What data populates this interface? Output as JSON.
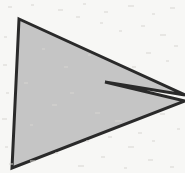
{
  "image": {
    "kind": "scanned-line-drawing",
    "width": 185,
    "height": 173,
    "background_color": "#f7f7f5",
    "description": "Concave arrow-like polygon, gray fill with dark outline, scanned paper texture"
  },
  "shape": {
    "name": "concave-arrow-polygon",
    "fill_color": "#c5c5c5",
    "stroke_color": "#2a2a2a",
    "stroke_width": 3,
    "vertex_count": 5,
    "points": "19,19 185,95 105,82 185,101 12,168",
    "vertices": [
      {
        "label": "top-left-apex",
        "x": 19,
        "y": 19
      },
      {
        "label": "upper-right-tip",
        "x": 185,
        "y": 95
      },
      {
        "label": "concave-notch",
        "x": 105,
        "y": 82
      },
      {
        "label": "lower-right-tip",
        "x": 185,
        "y": 101
      },
      {
        "label": "bottom-left-apex",
        "x": 12,
        "y": 168
      }
    ]
  },
  "texture": {
    "speck_color": "#d8d6d2",
    "speck_count": 46,
    "specks": [
      {
        "x": 8,
        "y": 6,
        "w": 4,
        "h": 2
      },
      {
        "x": 31,
        "y": 4,
        "w": 3,
        "h": 2
      },
      {
        "x": 58,
        "y": 9,
        "w": 5,
        "h": 2
      },
      {
        "x": 83,
        "y": 3,
        "w": 3,
        "h": 2
      },
      {
        "x": 104,
        "y": 11,
        "w": 4,
        "h": 2
      },
      {
        "x": 128,
        "y": 5,
        "w": 6,
        "h": 2
      },
      {
        "x": 152,
        "y": 13,
        "w": 3,
        "h": 2
      },
      {
        "x": 170,
        "y": 7,
        "w": 5,
        "h": 2
      },
      {
        "x": 141,
        "y": 25,
        "w": 4,
        "h": 2
      },
      {
        "x": 160,
        "y": 34,
        "w": 6,
        "h": 2
      },
      {
        "x": 119,
        "y": 30,
        "w": 3,
        "h": 2
      },
      {
        "x": 174,
        "y": 45,
        "w": 4,
        "h": 2
      },
      {
        "x": 146,
        "y": 52,
        "w": 5,
        "h": 2
      },
      {
        "x": 166,
        "y": 60,
        "w": 3,
        "h": 2
      },
      {
        "x": 132,
        "y": 66,
        "w": 4,
        "h": 2
      },
      {
        "x": 100,
        "y": 22,
        "w": 3,
        "h": 2
      },
      {
        "x": 76,
        "y": 16,
        "w": 4,
        "h": 2
      },
      {
        "x": 4,
        "y": 36,
        "w": 3,
        "h": 2
      },
      {
        "x": 3,
        "y": 64,
        "w": 4,
        "h": 2
      },
      {
        "x": 6,
        "y": 92,
        "w": 3,
        "h": 2
      },
      {
        "x": 2,
        "y": 118,
        "w": 5,
        "h": 2
      },
      {
        "x": 5,
        "y": 146,
        "w": 3,
        "h": 2
      },
      {
        "x": 9,
        "y": 163,
        "w": 4,
        "h": 2
      },
      {
        "x": 30,
        "y": 160,
        "w": 5,
        "h": 2
      },
      {
        "x": 55,
        "y": 152,
        "w": 3,
        "h": 2
      },
      {
        "x": 78,
        "y": 165,
        "w": 6,
        "h": 2
      },
      {
        "x": 101,
        "y": 156,
        "w": 4,
        "h": 2
      },
      {
        "x": 124,
        "y": 167,
        "w": 3,
        "h": 2
      },
      {
        "x": 148,
        "y": 159,
        "w": 5,
        "h": 2
      },
      {
        "x": 170,
        "y": 166,
        "w": 4,
        "h": 2
      },
      {
        "x": 115,
        "y": 120,
        "w": 7,
        "h": 2
      },
      {
        "x": 138,
        "y": 132,
        "w": 4,
        "h": 2
      },
      {
        "x": 160,
        "y": 113,
        "w": 5,
        "h": 2
      },
      {
        "x": 177,
        "y": 128,
        "w": 3,
        "h": 2
      },
      {
        "x": 128,
        "y": 146,
        "w": 6,
        "h": 2
      },
      {
        "x": 152,
        "y": 140,
        "w": 3,
        "h": 2
      },
      {
        "x": 108,
        "y": 136,
        "w": 4,
        "h": 2
      },
      {
        "x": 95,
        "y": 112,
        "w": 5,
        "h": 2
      },
      {
        "x": 86,
        "y": 140,
        "w": 3,
        "h": 2
      },
      {
        "x": 64,
        "y": 66,
        "w": 4,
        "h": 2
      },
      {
        "x": 42,
        "y": 48,
        "w": 3,
        "h": 2
      },
      {
        "x": 52,
        "y": 104,
        "w": 5,
        "h": 2
      },
      {
        "x": 30,
        "y": 124,
        "w": 3,
        "h": 2
      },
      {
        "x": 70,
        "y": 92,
        "w": 4,
        "h": 2
      },
      {
        "x": 88,
        "y": 54,
        "w": 3,
        "h": 2
      },
      {
        "x": 24,
        "y": 82,
        "w": 4,
        "h": 2
      }
    ]
  }
}
